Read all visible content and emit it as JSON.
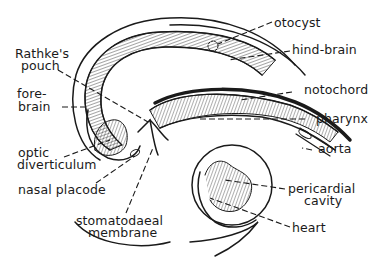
{
  "diagram": {
    "type": "anatomical-line-drawing",
    "colors": {
      "ink": "#1a1a1a",
      "background": "#ffffff"
    },
    "labels": {
      "otocyst": "otocyst",
      "hind_brain": "hind-brain",
      "rathkes_pouch_l1": "Rathke's",
      "rathkes_pouch_l2": "pouch",
      "fore_brain_l1": "fore-",
      "fore_brain_l2": "brain",
      "notochord": "notochord",
      "pharynx": "pharynx",
      "optic_l1": "optic",
      "optic_l2": "diverticulum",
      "aorta": "aorta",
      "nasal_placode": "nasal placode",
      "pericardial_l1": "pericardial",
      "pericardial_l2": "cavity",
      "stomatodaeal_l1": "stomatodaeal",
      "stomatodaeal_l2": "membrane",
      "heart": "heart"
    }
  }
}
